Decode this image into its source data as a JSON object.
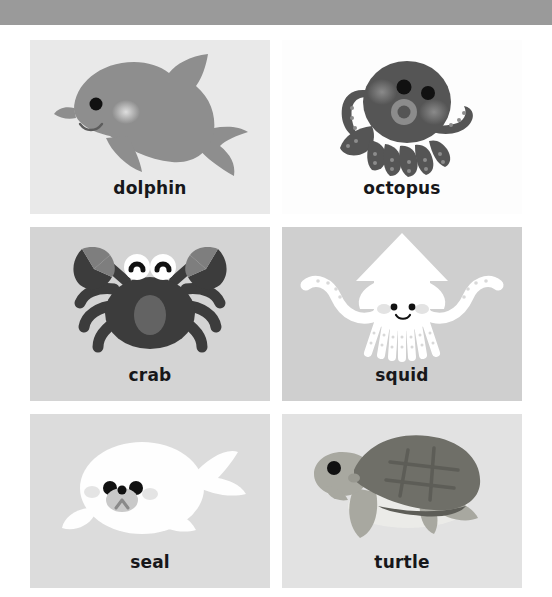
{
  "page": {
    "background_color": "#ffffff",
    "width": 552,
    "height": 597
  },
  "top_bar": {
    "color": "#9a9a9a",
    "height": 25
  },
  "label_style": {
    "color": "#17171a",
    "font_size": 17,
    "weight": "bold"
  },
  "cards": [
    {
      "id": "dolphin",
      "label": "dolphin",
      "icon_name": "dolphin-illustration",
      "card_background": "#e9e9e9",
      "body_color": "#8e8e8e",
      "accent_color": "#c9c9c9",
      "eye_color": "#111111",
      "row": 1,
      "column": 1
    },
    {
      "id": "octopus",
      "label": "octopus",
      "icon_name": "octopus-illustration",
      "card_background": "#fdfdfd",
      "body_color": "#555555",
      "accent_color": "#8c8c8c",
      "eye_color": "#111111",
      "row": 1,
      "column": 2
    },
    {
      "id": "crab",
      "label": "crab",
      "icon_name": "crab-illustration",
      "card_background": "#d4d4d4",
      "body_color": "#3c3c3c",
      "accent_color": "#7e7e7e",
      "eye_color": "#111111",
      "row": 2,
      "column": 1
    },
    {
      "id": "squid",
      "label": "squid",
      "icon_name": "squid-illustration",
      "card_background": "#cfcfcf",
      "body_color": "#ffffff",
      "accent_color": "#e8e8e8",
      "eye_color": "#111111",
      "row": 2,
      "column": 2
    },
    {
      "id": "seal",
      "label": "seal",
      "icon_name": "seal-illustration",
      "card_background": "#dcdcdc",
      "body_color": "#fefefe",
      "accent_color": "#b5b5b5",
      "eye_color": "#111111",
      "row": 3,
      "column": 1
    },
    {
      "id": "turtle",
      "label": "turtle",
      "icon_name": "turtle-illustration",
      "card_background": "#e2e2e2",
      "body_color": "#a8a8a0",
      "accent_color": "#6f6f68",
      "eye_color": "#111111",
      "row": 3,
      "column": 2
    }
  ]
}
